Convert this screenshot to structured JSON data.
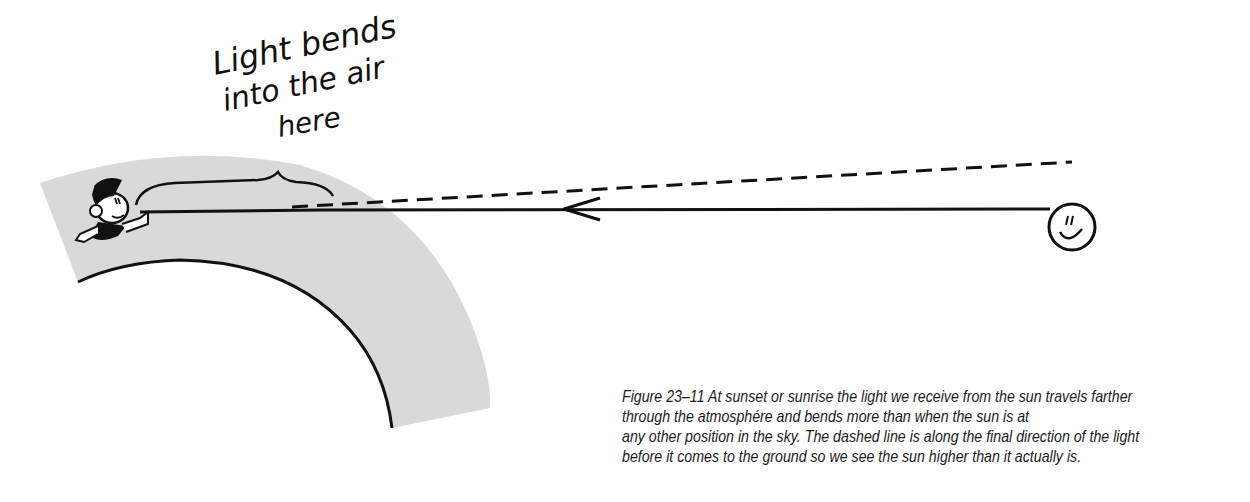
{
  "figure": {
    "label": {
      "lines": [
        "Light bends",
        "into the air",
        "here"
      ]
    },
    "caption": {
      "lines": [
        "Figure 23–11 At sunset or sunrise the light we receive from the sun travels farther",
        "through the atmosphére and bends more than when the sun is at",
        "any other position in the sky. The dashed line is along the final direction of the light",
        "before it comes to the ground so we see the sun higher than it actually is."
      ]
    },
    "elements": {
      "observer": "cartoon-person-icon",
      "sun": "smiling-sun-icon",
      "earth_surface": "earth-arc",
      "atmosphere": "atmosphere-band",
      "actual_ray": "solid-light-ray-with-arrow",
      "apparent_direction": "dashed-apparent-line",
      "bracket": "curly-brace"
    },
    "colors": {
      "atmosphere": "#d9d9d9",
      "ink": "#111111",
      "background": "#ffffff"
    }
  }
}
